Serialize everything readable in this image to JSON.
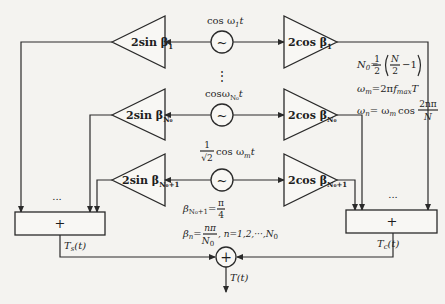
{
  "diagram": {
    "type": "signal-flow block diagram",
    "channels": [
      {
        "id": "1",
        "sin_amp_label": "2sin β",
        "sin_amp_sub": "1",
        "oscillator_label": "cos ω",
        "oscillator_sub": "1",
        "oscillator_suffix": "t",
        "cos_amp_label": "2cos β",
        "cos_amp_sub": "1"
      },
      {
        "id": "N0",
        "sin_amp_label": "2sin β",
        "sin_amp_sub": "N₀",
        "oscillator_label": "cosω",
        "oscillator_sub": "N₀",
        "oscillator_suffix": "t",
        "cos_amp_label": "2cos β",
        "cos_amp_sub": "N₀"
      },
      {
        "id": "N0+1",
        "sin_amp_label": "2sin β",
        "sin_amp_sub": "N₀+1",
        "oscillator_prefix_num": "1",
        "oscillator_prefix_den": "√2",
        "oscillator_label": "cos ω",
        "oscillator_sub": "m",
        "oscillator_suffix": "t",
        "cos_amp_label": "2cos β",
        "cos_amp_sub": "N₀+1"
      }
    ],
    "oscillator_symbol": "~",
    "vertical_ellipsis": "⋮",
    "horizontal_ellipsis": "...",
    "left_summer": {
      "symbol": "+",
      "output_label": "T",
      "output_sub": "s",
      "output_suffix": "(t)"
    },
    "right_summer": {
      "symbol": "+",
      "output_label": "T",
      "output_sub": "c",
      "output_suffix": "(t)"
    },
    "final_adder": {
      "symbol": "+",
      "output_label": "T(t)"
    },
    "equations": {
      "n0_lhs": "N",
      "n0_lhs_sub": "0",
      "n0_eq": "=",
      "n0_frac_num": "1",
      "n0_frac_den": "2",
      "n0_inner_num": "N",
      "n0_inner_den": "2",
      "n0_minus": "−1",
      "wm_lhs": "ω",
      "wm_lhs_sub": "m",
      "wm_rhs_pre": "=2π",
      "wm_rhs_f": "f",
      "wm_rhs_f_sub": "max",
      "wm_rhs_post": "T",
      "wn_lhs": "ω",
      "wn_lhs_sub": "n",
      "wn_rhs_pre": "= ω",
      "wn_rhs_sub": "m",
      "wn_rhs_cos": "cos",
      "wn_frac_num": "2nπ",
      "wn_frac_den": "N",
      "beta_n0p1_lhs": "β",
      "beta_n0p1_sub": "N₀+1",
      "beta_n0p1_eq": "=",
      "beta_n0p1_num": "π",
      "beta_n0p1_den": "4",
      "beta_n_lhs": "β",
      "beta_n_sub": "n",
      "beta_n_eq": "=",
      "beta_n_num": "nπ",
      "beta_n_den": "N",
      "beta_n_den_sub": "0",
      "beta_n_range": ",  n=1,2,···,N",
      "beta_n_range_sub": "0"
    }
  }
}
